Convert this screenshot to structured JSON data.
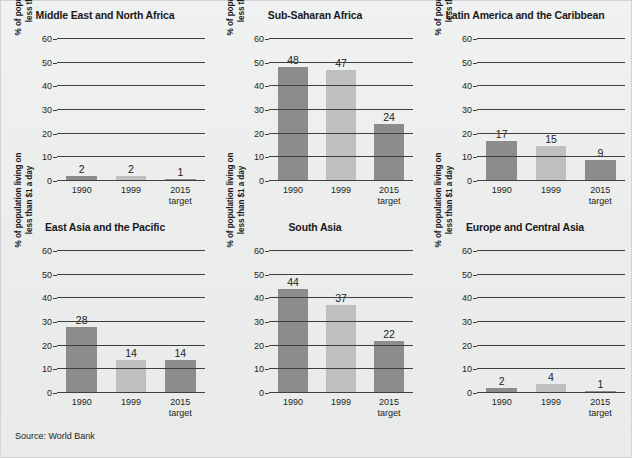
{
  "figure": {
    "source_note": "Source: World Bank",
    "background_color": "#eceded",
    "axis_caption_line1": "% of population living on",
    "axis_caption_line2": "less than $1 a day",
    "colors": {
      "bar_dark": "#8c8c8c",
      "bar_light": "#bfbfbf",
      "axis": "#3e3e3e",
      "text": "#231f20"
    }
  },
  "chart_data": [
    {
      "type": "bar",
      "title": "Middle East and North Africa",
      "categories": [
        "1990",
        "1999",
        "2015 target"
      ],
      "values": [
        2,
        2,
        1
      ],
      "xlabel": "",
      "ylabel": "% of population living on less than $1 a day",
      "ylim": [
        0,
        60
      ],
      "yticks": [
        0,
        10,
        20,
        30,
        40,
        50,
        60
      ],
      "grid": true,
      "legend": "none",
      "series_colors": [
        "#8c8c8c",
        "#bfbfbf",
        "#8c8c8c"
      ]
    },
    {
      "type": "bar",
      "title": "Sub-Saharan Africa",
      "categories": [
        "1990",
        "1999",
        "2015 target"
      ],
      "values": [
        48,
        47,
        24
      ],
      "xlabel": "",
      "ylabel": "% of population living on less than $1 a day",
      "ylim": [
        0,
        60
      ],
      "yticks": [
        0,
        10,
        20,
        30,
        40,
        50,
        60
      ],
      "grid": true,
      "legend": "none",
      "series_colors": [
        "#8c8c8c",
        "#bfbfbf",
        "#8c8c8c"
      ]
    },
    {
      "type": "bar",
      "title": "Latin America and the Caribbean",
      "categories": [
        "1990",
        "1999",
        "2015 target"
      ],
      "values": [
        17,
        15,
        9
      ],
      "xlabel": "",
      "ylabel": "% of population living on less than $1 a day",
      "ylim": [
        0,
        60
      ],
      "yticks": [
        0,
        10,
        20,
        30,
        40,
        50,
        60
      ],
      "grid": true,
      "legend": "none",
      "series_colors": [
        "#8c8c8c",
        "#bfbfbf",
        "#8c8c8c"
      ]
    },
    {
      "type": "bar",
      "title": "East Asia and the Pacific",
      "categories": [
        "1990",
        "1999",
        "2015 target"
      ],
      "values": [
        28,
        14,
        14
      ],
      "xlabel": "",
      "ylabel": "% of population living on less than $1 a day",
      "ylim": [
        0,
        60
      ],
      "yticks": [
        0,
        10,
        20,
        30,
        40,
        50,
        60
      ],
      "grid": true,
      "legend": "none",
      "series_colors": [
        "#8c8c8c",
        "#bfbfbf",
        "#8c8c8c"
      ]
    },
    {
      "type": "bar",
      "title": "South Asia",
      "categories": [
        "1990",
        "1999",
        "2015 target"
      ],
      "values": [
        44,
        37,
        22
      ],
      "xlabel": "",
      "ylabel": "% of population living on less than $1 a day",
      "ylim": [
        0,
        60
      ],
      "yticks": [
        0,
        10,
        20,
        30,
        40,
        50,
        60
      ],
      "grid": true,
      "legend": "none",
      "series_colors": [
        "#8c8c8c",
        "#bfbfbf",
        "#8c8c8c"
      ]
    },
    {
      "type": "bar",
      "title": "Europe and Central Asia",
      "categories": [
        "1990",
        "1999",
        "2015 target"
      ],
      "values": [
        2,
        4,
        1
      ],
      "xlabel": "",
      "ylabel": "% of population living on less than $1 a day",
      "ylim": [
        0,
        60
      ],
      "yticks": [
        0,
        10,
        20,
        30,
        40,
        50,
        60
      ],
      "grid": true,
      "legend": "none",
      "series_colors": [
        "#8c8c8c",
        "#bfbfbf",
        "#8c8c8c"
      ]
    }
  ]
}
